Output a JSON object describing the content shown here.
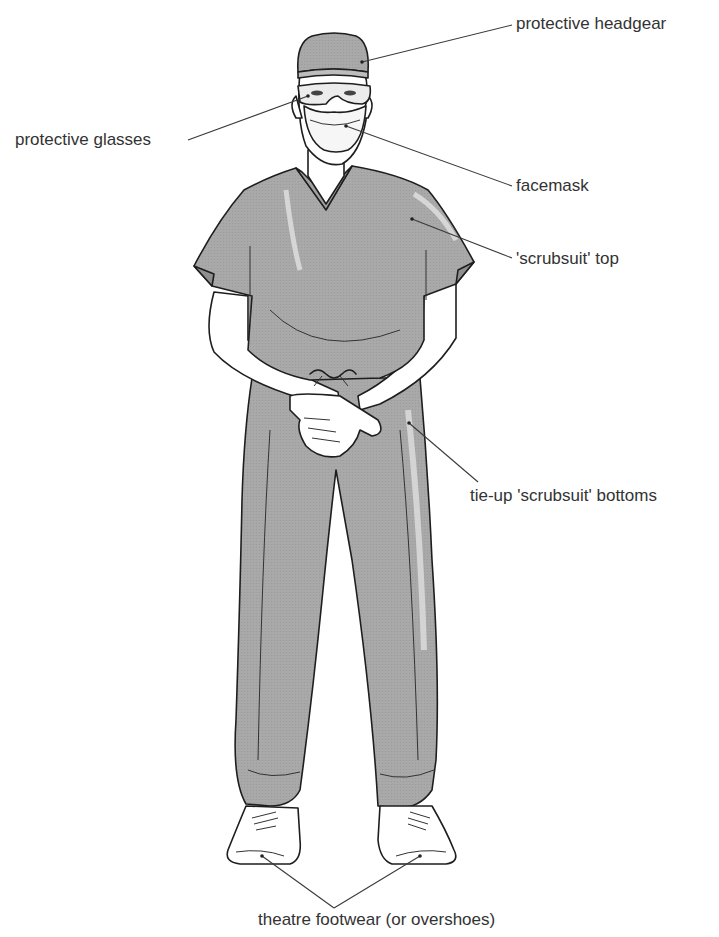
{
  "figure": {
    "colors": {
      "scrubs": "#a7a7a7",
      "scrubs_shade": "#8f8f8f",
      "highlight": "#cfcfcf",
      "skin": "#ffffff",
      "outline": "#1e1e1e",
      "text": "#333333"
    }
  },
  "labels": {
    "headgear": "protective headgear",
    "glasses": "protective glasses",
    "facemask": "facemask",
    "top": "'scrubsuit' top",
    "bottoms": "tie-up 'scrubsuit' bottoms",
    "footwear": "theatre footwear (or overshoes)"
  }
}
